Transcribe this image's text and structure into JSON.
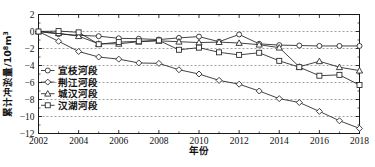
{
  "figure": {
    "caption": "",
    "y_axis_title": "累计冲淤量/10",
    "y_axis_title_sup": "8",
    "y_axis_title_tail": "m",
    "y_axis_title_sup2": "3",
    "x_axis_title": "年份"
  },
  "chart_data": {
    "type": "line",
    "title": "",
    "xlabel": "年份",
    "ylabel": "累计冲淤量/10^8 m^3",
    "xlim": [
      2002,
      2018
    ],
    "ylim": [
      -12,
      2
    ],
    "xticks": [
      2002,
      2004,
      2006,
      2008,
      2010,
      2012,
      2014,
      2016,
      2018
    ],
    "yticks": [
      2,
      0,
      -2,
      -4,
      -6,
      -8,
      -10,
      -12
    ],
    "xtick_labels": [
      "2002",
      "2004",
      "2006",
      "2008",
      "2010",
      "2012",
      "2014",
      "2016",
      "2018"
    ],
    "ytick_labels": [
      "2",
      "0",
      "−2",
      "−4",
      "−6",
      "−8",
      "−10",
      "−12"
    ],
    "grid": true,
    "legend_position": "lower-left",
    "x": [
      2002,
      2003,
      2004,
      2005,
      2006,
      2007,
      2008,
      2009,
      2010,
      2011,
      2012,
      2013,
      2014,
      2015,
      2016,
      2017,
      2018
    ],
    "series": [
      {
        "name": "宜枝河段",
        "marker": "circle",
        "values": [
          0,
          -0.3,
          -0.45,
          -0.55,
          -0.8,
          -0.85,
          -0.95,
          -0.75,
          -0.6,
          -1.2,
          -0.35,
          -1.45,
          -1.6,
          -1.65,
          -1.7,
          -1.7,
          -1.7
        ]
      },
      {
        "name": "荆江河段",
        "marker": "diamond",
        "values": [
          0,
          -1.15,
          -2.35,
          -3.0,
          -3.25,
          -3.7,
          -3.75,
          -4.5,
          -5.0,
          -5.75,
          -6.2,
          -7.0,
          -7.9,
          -8.35,
          -9.4,
          -10.5,
          -11.4
        ]
      },
      {
        "name": "城汉河段",
        "marker": "triangle",
        "values": [
          0,
          -0.2,
          -0.55,
          -1.45,
          -1.45,
          -1.2,
          -1.1,
          -1.2,
          -1.3,
          -1.25,
          -1.35,
          -1.55,
          -1.9,
          -4.15,
          -3.5,
          -4.2,
          -4.6
        ]
      },
      {
        "name": "汉湖河段",
        "marker": "square",
        "values": [
          0,
          0.05,
          -0.1,
          -1.5,
          -1.25,
          -1.15,
          -1.05,
          -2.15,
          -1.9,
          -2.45,
          -2.75,
          -2.5,
          -3.45,
          -4.2,
          -5.2,
          -5.1,
          -6.3
        ]
      }
    ]
  }
}
